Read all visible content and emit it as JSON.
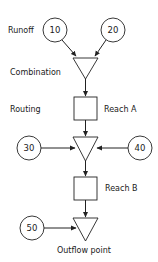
{
  "labels": {
    "runoff": "Runoff",
    "combination": "Combination",
    "routing": "Routing",
    "reach_a": "Reach A",
    "reach_b": "Reach B",
    "outflow": "Outflow point"
  },
  "nodes": {
    "n10": "10",
    "n20": "20",
    "n30": "30",
    "n40": "40",
    "n50": "50"
  },
  "colors": {
    "stroke": "#222222",
    "background": "#ffffff"
  }
}
